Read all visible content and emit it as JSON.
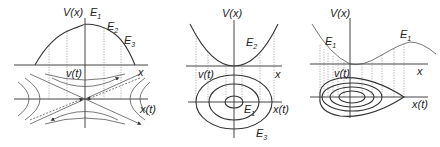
{
  "panels": [
    {
      "name": "inverted-parabola-potential",
      "potential_label": "V(x)",
      "energy_labels": [
        {
          "base": "E",
          "sub": "1"
        },
        {
          "base": "E",
          "sub": "2"
        },
        {
          "base": "E",
          "sub": "3"
        }
      ],
      "x_axis_label": "x",
      "phase_v_label": "v(t)",
      "phase_x_label": "x(t)",
      "phase_portrait": "saddle (hyperbolic trajectories)"
    },
    {
      "name": "parabolic-well-potential",
      "potential_label": "V(x)",
      "energy_labels": [
        {
          "base": "E",
          "sub": "2"
        },
        {
          "base": "E",
          "sub": "1"
        },
        {
          "base": "E",
          "sub": "3"
        }
      ],
      "x_axis_label": "x",
      "phase_v_label": "v(t)",
      "phase_x_label": "x(t)",
      "phase_portrait": "center (nested ellipses)"
    },
    {
      "name": "cubic-potential",
      "potential_label": "V(x)",
      "energy_labels": [
        {
          "base": "E",
          "sub": "1"
        },
        {
          "base": "E",
          "sub": "1"
        }
      ],
      "x_axis_label": "x",
      "phase_v_label": "v(t)",
      "phase_x_label": "x(t)",
      "phase_portrait": "closed orbits bounded by homoclinic loop"
    }
  ]
}
